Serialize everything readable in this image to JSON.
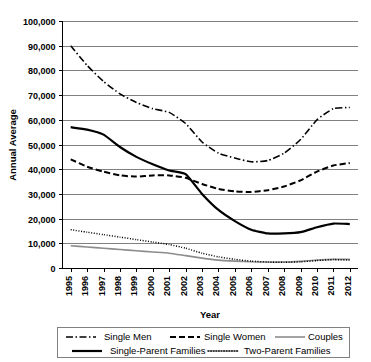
{
  "chart_data": {
    "type": "line",
    "title": "",
    "xlabel": "Year",
    "ylabel": "Annual Average",
    "x": [
      1995,
      1996,
      1997,
      1998,
      1999,
      2000,
      2001,
      2002,
      2003,
      2004,
      2005,
      2006,
      2007,
      2008,
      2009,
      2010,
      2011,
      2012
    ],
    "xtick_labels": [
      "1995",
      "1996",
      "1997",
      "1998",
      "1999",
      "2000",
      "2001",
      "2002",
      "2003",
      "2004",
      "2005",
      "2006",
      "2007",
      "2008",
      "2009",
      "2010",
      "2011",
      "2012"
    ],
    "ylim": [
      0,
      100000
    ],
    "ytick_values": [
      0,
      10000,
      20000,
      30000,
      40000,
      50000,
      60000,
      70000,
      80000,
      90000,
      100000
    ],
    "ytick_labels": [
      "0",
      "10,000",
      "20,000",
      "30,000",
      "40,000",
      "50,000",
      "60,000",
      "70,000",
      "80,000",
      "90,000",
      "100,000"
    ],
    "grid": true,
    "legend_position": "bottom",
    "series": [
      {
        "name": "Single Men",
        "style": "dash-dot",
        "color": "#000000",
        "width": 1.6,
        "dasharray": "7,2.5,1.5,2.5",
        "values": [
          90000,
          82000,
          75500,
          70500,
          67000,
          64500,
          63000,
          58500,
          51000,
          46500,
          44500,
          43000,
          43500,
          46500,
          52000,
          60000,
          64500,
          65000
        ]
      },
      {
        "name": "Single Women",
        "style": "dashed",
        "color": "#000000",
        "width": 2.0,
        "dasharray": "6,3",
        "values": [
          44000,
          41000,
          39000,
          37500,
          37000,
          37500,
          37500,
          36500,
          34000,
          32000,
          31000,
          30800,
          31500,
          33000,
          35500,
          39000,
          41500,
          42500
        ]
      },
      {
        "name": "Couples",
        "style": "solid-thin",
        "color": "#8c8c8c",
        "width": 1.6,
        "dasharray": "",
        "values": [
          9000,
          8500,
          8000,
          7500,
          7000,
          6500,
          6000,
          5000,
          4000,
          3200,
          2800,
          2500,
          2400,
          2400,
          2700,
          3200,
          3500,
          3500
        ]
      },
      {
        "name": "Single-Parent Families",
        "style": "solid-thick",
        "color": "#000000",
        "width": 2.2,
        "dasharray": "",
        "values": [
          57000,
          56000,
          54000,
          49000,
          45000,
          42000,
          39500,
          38000,
          30000,
          23500,
          19000,
          15500,
          14000,
          14000,
          14500,
          16500,
          18000,
          17800
        ]
      },
      {
        "name": "Two-Parent Families",
        "style": "dotted",
        "color": "#000000",
        "width": 1.5,
        "dasharray": "1,1.6",
        "values": [
          15500,
          14500,
          13500,
          12500,
          11500,
          10500,
          9500,
          8000,
          6000,
          4500,
          3500,
          2800,
          2400,
          2300,
          2500,
          3000,
          3400,
          3200
        ]
      }
    ]
  },
  "legend": {
    "entries": [
      {
        "label": "Single Men"
      },
      {
        "label": "Single Women"
      },
      {
        "label": "Couples"
      },
      {
        "label": "Single-Parent Families"
      },
      {
        "label": "Two-Parent Families"
      }
    ]
  }
}
